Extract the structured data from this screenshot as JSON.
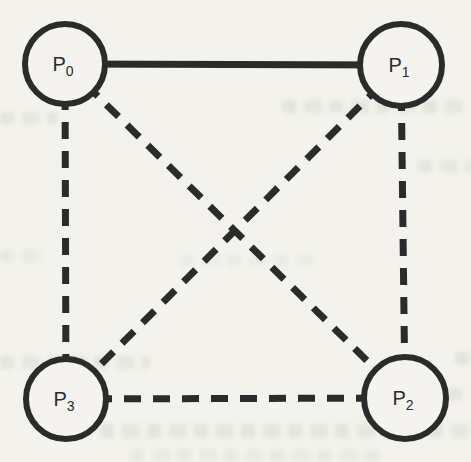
{
  "diagram": {
    "type": "graph",
    "background_color": "#f3f2ed",
    "ink_color": "#2b2b2b",
    "node_fill": "#f4f3ef",
    "nodes": [
      {
        "id": "P0",
        "label": "P",
        "sub": "0",
        "position": "top-left",
        "x": 65,
        "y": 64,
        "r": 40
      },
      {
        "id": "P1",
        "label": "P",
        "sub": "1",
        "position": "top-right",
        "x": 401,
        "y": 65,
        "r": 41
      },
      {
        "id": "P2",
        "label": "P",
        "sub": "2",
        "position": "bottom-right",
        "x": 405,
        "y": 398,
        "r": 41
      },
      {
        "id": "P3",
        "label": "P",
        "sub": "3",
        "position": "bottom-left",
        "x": 66,
        "y": 399,
        "r": 40
      }
    ],
    "edges": [
      {
        "from": "P0",
        "to": "P1",
        "style": "solid"
      },
      {
        "from": "P0",
        "to": "P3",
        "style": "dashed"
      },
      {
        "from": "P1",
        "to": "P2",
        "style": "dashed"
      },
      {
        "from": "P3",
        "to": "P2",
        "style": "dashed"
      },
      {
        "from": "P0",
        "to": "P2",
        "style": "dashed"
      },
      {
        "from": "P1",
        "to": "P3",
        "style": "dashed"
      }
    ],
    "edge_stroke_width": 7,
    "node_stroke_width": 6,
    "dash_pattern": [
      17,
      12
    ]
  }
}
